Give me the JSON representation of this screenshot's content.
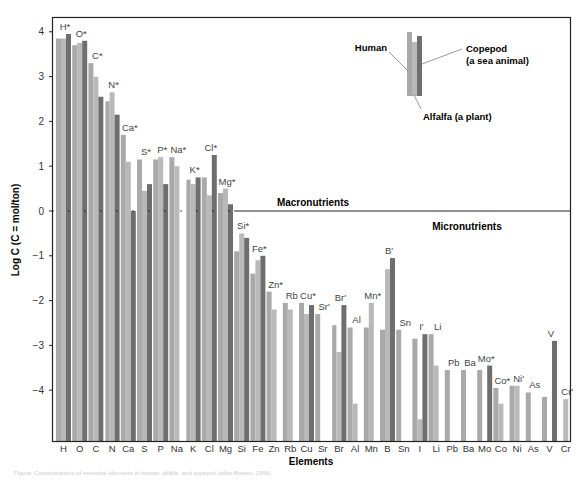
{
  "chart_data": {
    "type": "bar",
    "title": "",
    "xlabel": "Elements",
    "ylabel": "Log C (C = mol/ton)",
    "ylim": [
      -5.1,
      4.2
    ],
    "yticks": [
      4,
      3,
      2,
      1,
      0,
      -1,
      -2,
      -3,
      -4
    ],
    "ytick_labels": [
      "4",
      "3",
      "2",
      "1",
      "0",
      "−1",
      "−2",
      "−3",
      "−4"
    ],
    "grid": false,
    "legend": {
      "position": "upper-right",
      "entries": [
        "Human",
        "Alfalfa (a plant)",
        "Copepod (a sea animal)"
      ],
      "labels": {
        "human": "Human",
        "copepod_line1": "Copepod",
        "copepod_line2": "(a sea animal)",
        "alfalfa": "Alfalfa (a plant)"
      }
    },
    "region_labels": {
      "macro": "Macronutrients",
      "micro": "Micronutrients"
    },
    "categories": [
      "H",
      "O",
      "C",
      "N",
      "Ca",
      "S",
      "P",
      "Na",
      "K",
      "Cl",
      "Mg",
      "Si",
      "Fe",
      "Zn",
      "Rb",
      "Cu",
      "Sr",
      "Br",
      "Al",
      "Mn",
      "B",
      "Sn",
      "I",
      "Li",
      "Pb",
      "Ba",
      "Mo",
      "Co",
      "Ni",
      "As",
      "V",
      "Cr"
    ],
    "bar_labels": [
      "H*",
      "O*",
      "C*",
      "N*",
      "Ca*",
      "S*",
      "P*",
      "Na*",
      "K*",
      "Cl*",
      "Mg*",
      "Si*",
      "Fe*",
      "Zn*",
      "Rb",
      "Cu*",
      "Sr'",
      "Br'",
      "Al",
      "Mn*",
      "B'",
      "Sn",
      "I'",
      "Li",
      "Pb",
      "Ba",
      "Mo*",
      "Co*",
      "Ni'",
      "As",
      "V",
      "Cr'"
    ],
    "series": [
      {
        "name": "Human",
        "color": "#a9a9a9",
        "values": [
          3.85,
          3.7,
          3.3,
          2.45,
          1.7,
          1.15,
          1.15,
          1.2,
          0.7,
          0.75,
          0.4,
          -0.9,
          -1.4,
          -1.8,
          -2.05,
          -2.05,
          -2.3,
          -2.55,
          -2.6,
          -2.6,
          -2.65,
          -2.65,
          -2.85,
          -2.75,
          -3.55,
          -3.55,
          -3.55,
          -3.95,
          -3.9,
          -4.05,
          -4.15,
          null
        ]
      },
      {
        "name": "Alfalfa (a plant)",
        "color": "#b9b9b9",
        "values": [
          3.85,
          3.75,
          3.0,
          2.65,
          1.1,
          0.45,
          1.2,
          1.0,
          0.6,
          0.35,
          0.5,
          -0.5,
          -1.1,
          -2.2,
          -2.2,
          -2.3,
          null,
          -3.15,
          -4.3,
          -2.05,
          -1.3,
          null,
          -4.65,
          -3.45,
          null,
          null,
          null,
          -4.3,
          -3.9,
          null,
          null,
          -4.2
        ]
      },
      {
        "name": "Copepod (a sea animal)",
        "color": "#6e6e6e",
        "values": [
          3.95,
          3.8,
          2.55,
          2.15,
          0.0,
          0.6,
          0.6,
          null,
          0.75,
          1.25,
          0.15,
          -0.6,
          -1.0,
          null,
          null,
          -2.1,
          null,
          -2.1,
          null,
          null,
          -1.05,
          null,
          -2.75,
          null,
          null,
          null,
          -3.45,
          null,
          null,
          null,
          -2.9,
          null
        ]
      }
    ]
  },
  "caption": "Figure: Concentrations of essential elements in human, alfalfa, and copepod (after Bowen, 1966)"
}
